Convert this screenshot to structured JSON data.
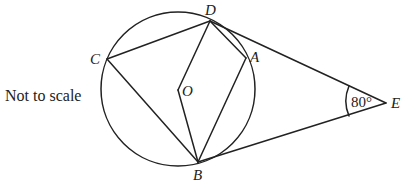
{
  "note": "Not to scale",
  "points": {
    "D": {
      "label": "D",
      "x": 210,
      "y": 21
    },
    "C": {
      "label": "C",
      "x": 107,
      "y": 59
    },
    "A": {
      "label": "A",
      "x": 246,
      "y": 58
    },
    "O": {
      "label": "O",
      "x": 178,
      "y": 90
    },
    "B": {
      "label": "B",
      "x": 198,
      "y": 162
    },
    "E": {
      "label": "E",
      "x": 386,
      "y": 103
    }
  },
  "circle": {
    "cx": 178,
    "cy": 89,
    "r": 77
  },
  "angle_E": {
    "label": "80°",
    "value": 80
  },
  "segments": [
    [
      "D",
      "C"
    ],
    [
      "C",
      "B"
    ],
    [
      "D",
      "O"
    ],
    [
      "O",
      "B"
    ],
    [
      "D",
      "A"
    ],
    [
      "A",
      "B"
    ],
    [
      "D",
      "E"
    ],
    [
      "B",
      "E"
    ]
  ],
  "colors": {
    "stroke": "#222222",
    "background": "#ffffff"
  }
}
